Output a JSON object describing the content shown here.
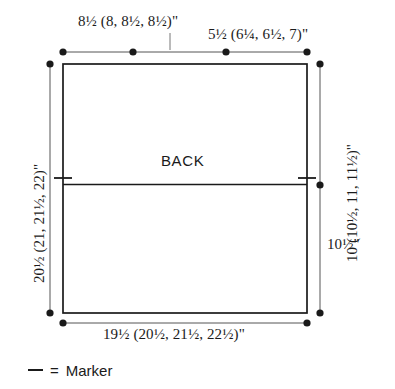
{
  "diagram": {
    "title_text": "BACK",
    "piece_label": "BACK",
    "legend": {
      "symbol_name": "marker-dash",
      "symbol": "—",
      "equals": "=",
      "text": "Marker",
      "full_text": "— = Marker"
    },
    "dimensions": {
      "top_left": "8½ (8, 8½, 8½)\"",
      "top_right": "5½ (6¼, 6½, 7)\"",
      "bottom": "19½ (20½, 21½, 22½)\"",
      "left": "20½ (21, 21½, 22)\"",
      "right_upper": "10 (10½, 11, 11½)\"",
      "right_lower": "10½\""
    },
    "colors": {
      "background": "#ffffff",
      "outline": "#1a1a1a",
      "dimension_line": "#555555",
      "text": "#1a1a1a"
    }
  }
}
